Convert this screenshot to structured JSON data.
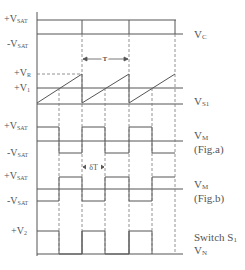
{
  "labels": {
    "vsat_pos_1": {
      "prefix": "+V",
      "sub": "SAT"
    },
    "vsat_neg_1": {
      "prefix": "-V",
      "sub": "SAT"
    },
    "vr": {
      "prefix": "+V",
      "sub": "R"
    },
    "v1": {
      "prefix": "+V",
      "sub": "1"
    },
    "vsat_pos_2": {
      "prefix": "+V",
      "sub": "SAT"
    },
    "vsat_neg_2": {
      "prefix": "-V",
      "sub": "SAT"
    },
    "vsat_pos_3": {
      "prefix": "+V",
      "sub": "SAT"
    },
    "vsat_neg_3": {
      "prefix": "-V",
      "sub": "SAT"
    },
    "v2": {
      "prefix": "+V",
      "sub": "2"
    }
  },
  "signals": {
    "vc": {
      "prefix": "V",
      "sub": "C"
    },
    "vs1": {
      "prefix": "V",
      "sub": "S1"
    },
    "vm_a": {
      "prefix": "V",
      "sub": "M",
      "caption": "(Fig.a)"
    },
    "vm_b": {
      "prefix": "V",
      "sub": "M",
      "caption": "(Fig.b)"
    },
    "switch": {
      "line1_prefix": "Switch S",
      "line1_sub": "1",
      "prefix": "V",
      "sub": "N"
    }
  },
  "annotations": {
    "period": "T",
    "duty": "δT"
  },
  "colors": {
    "line": "#555555",
    "dashed": "#777777",
    "text": "#555555"
  }
}
